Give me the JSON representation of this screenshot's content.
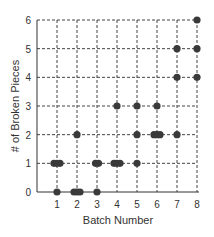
{
  "chart_data": {
    "type": "scatter",
    "title": "",
    "xlabel": "Batch Number",
    "ylabel": "# of Broken Pieces",
    "xlim": [
      0,
      8
    ],
    "ylim": [
      0,
      6
    ],
    "x_ticks": [
      1,
      2,
      3,
      4,
      5,
      6,
      7,
      8
    ],
    "y_ticks": [
      0,
      1,
      2,
      3,
      4,
      5,
      6
    ],
    "grid": true,
    "grid_style": "dashed",
    "legend": null,
    "points": [
      {
        "x": 1,
        "y": 0
      },
      {
        "x": 1,
        "y": 1
      },
      {
        "x": 1,
        "y": 1
      },
      {
        "x": 1,
        "y": 1
      },
      {
        "x": 2,
        "y": 0
      },
      {
        "x": 2,
        "y": 0
      },
      {
        "x": 2,
        "y": 0
      },
      {
        "x": 2,
        "y": 2
      },
      {
        "x": 3,
        "y": 0
      },
      {
        "x": 3,
        "y": 1
      },
      {
        "x": 3,
        "y": 1
      },
      {
        "x": 4,
        "y": 1
      },
      {
        "x": 4,
        "y": 1
      },
      {
        "x": 4,
        "y": 1
      },
      {
        "x": 4,
        "y": 3
      },
      {
        "x": 5,
        "y": 1
      },
      {
        "x": 5,
        "y": 2
      },
      {
        "x": 5,
        "y": 3
      },
      {
        "x": 6,
        "y": 2
      },
      {
        "x": 6,
        "y": 2
      },
      {
        "x": 6,
        "y": 2
      },
      {
        "x": 6,
        "y": 3
      },
      {
        "x": 7,
        "y": 2
      },
      {
        "x": 7,
        "y": 4
      },
      {
        "x": 7,
        "y": 5
      },
      {
        "x": 8,
        "y": 4
      },
      {
        "x": 8,
        "y": 5
      },
      {
        "x": 8,
        "y": 6
      }
    ],
    "marker_color": "#3a3a3a"
  }
}
